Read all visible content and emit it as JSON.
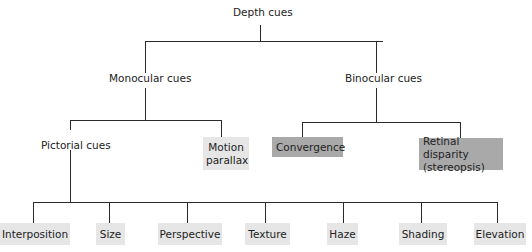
{
  "diagram": {
    "root": "Depth cues",
    "level1": {
      "monocular": "Monocular cues",
      "binocular": "Binocular cues"
    },
    "level2": {
      "pictorial": "Pictorial cues",
      "motion_parallax": "Motion parallax",
      "convergence": "Convergence",
      "retinal_disparity": "Retinal disparity (stereopsis)"
    },
    "pictorial_children": [
      "Interposition",
      "Size",
      "Perspective",
      "Texture",
      "Haze",
      "Shading",
      "Elevation"
    ],
    "colors": {
      "light_box": "#e6e6e6",
      "dark_box": "#a9a9a9",
      "line": "#2a2a2a"
    }
  }
}
